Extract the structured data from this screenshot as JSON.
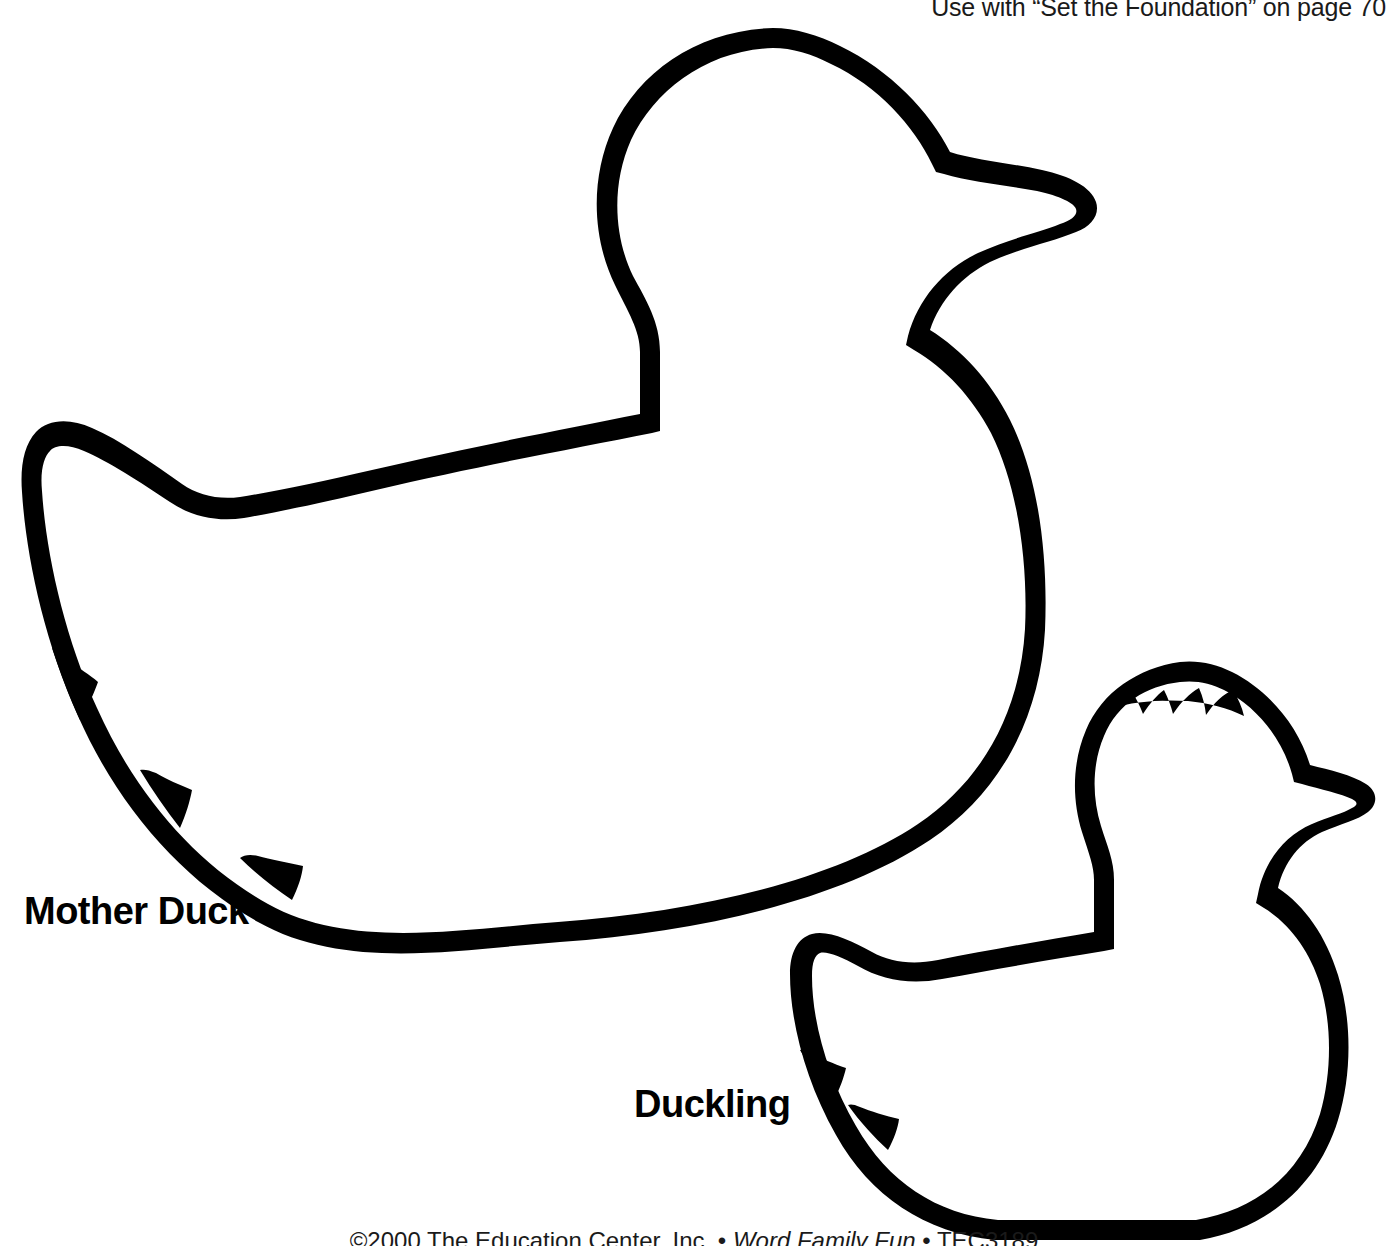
{
  "page": {
    "width": 1388,
    "height": 1246,
    "background_color": "#ffffff",
    "ink_color": "#000000"
  },
  "header": {
    "note": "Use with “Set the Foundation” on page 70"
  },
  "footer": {
    "copyright": "©2000 The Education Center, Inc. • ",
    "publication": "Word Family Fun",
    "product_code": " • TEC3189"
  },
  "shapes": [
    {
      "id": "mother-duck",
      "label": "Mother Duck",
      "label_position": {
        "x": 24,
        "y": 890
      },
      "outline_color": "#000000",
      "fill_color": "#ffffff",
      "stroke_width": 13,
      "tail_feather_notches": 3
    },
    {
      "id": "duckling",
      "label": "Duckling",
      "label_position": {
        "x": 634,
        "y": 1083
      },
      "outline_color": "#000000",
      "fill_color": "#ffffff",
      "stroke_width": 12,
      "tail_feather_notches": 2,
      "head_tuft_spikes": 4
    }
  ]
}
